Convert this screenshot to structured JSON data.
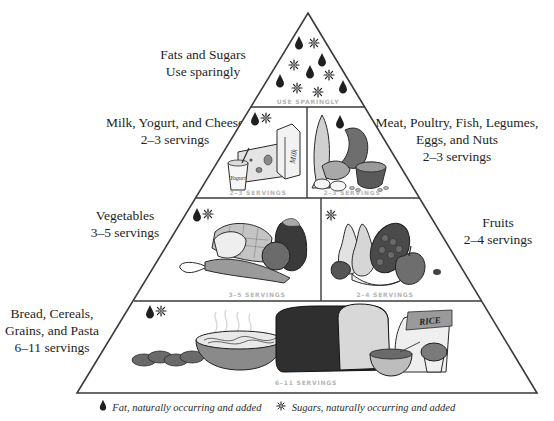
{
  "pyramid": {
    "tiers": [
      {
        "id": "fats-sugars",
        "group": "Fats and Sugars",
        "servings": "Use sparingly",
        "inner_label": "USE SPARINGLY",
        "symbols": [
          "fat-drop",
          "sugar-crystal"
        ]
      },
      {
        "id": "milk",
        "group": "Milk, Yogurt, and Cheese",
        "servings": "2–3 servings",
        "inner_label": "2–3 SERVINGS",
        "symbols": [
          "fat-drop",
          "sugar-crystal"
        ],
        "illustration": [
          "yogurt",
          "cheese",
          "milk carton"
        ],
        "carton_text": "Milk",
        "cup_text": "Yogurt"
      },
      {
        "id": "meat",
        "group_lines": [
          "Meat, Poultry, Fish, Legumes,",
          "Eggs, and Nuts"
        ],
        "servings": "2–3 servings",
        "inner_label": "2–3 SERVINGS",
        "symbols": [
          "fat-drop"
        ],
        "illustration": [
          "fish",
          "poultry",
          "eggs",
          "steak",
          "beans"
        ]
      },
      {
        "id": "vegetables",
        "group": "Vegetables",
        "servings": "3–5 servings",
        "inner_label": "3–5 SERVINGS",
        "symbols": [
          "fat-drop",
          "sugar-crystal"
        ],
        "illustration": [
          "corn",
          "lettuce",
          "carrot",
          "tomato",
          "eggplant"
        ]
      },
      {
        "id": "fruits",
        "group": "Fruits",
        "servings": "2–4 servings",
        "inner_label": "2–4 SERVINGS",
        "symbols": [
          "sugar-crystal"
        ],
        "illustration": [
          "pears",
          "grapes",
          "strawberry",
          "banana",
          "apple"
        ]
      },
      {
        "id": "grains",
        "group_lines": [
          "Bread, Cereals,",
          "Grains, and Pasta"
        ],
        "servings": "6–11 servings",
        "inner_label": "6–11 SERVINGS",
        "symbols": [
          "fat-drop",
          "sugar-crystal"
        ],
        "illustration": [
          "braided bread",
          "pasta bowl",
          "bread loaf",
          "rice bag",
          "cereal bowl",
          "muffin"
        ],
        "rice_bag_text": "RICE"
      }
    ]
  },
  "legend": {
    "fat": {
      "icon": "fat-drop-icon",
      "label": "Fat, naturally occurring and added"
    },
    "sugar": {
      "icon": "sugar-crystal-icon",
      "label": "Sugars, naturally occurring and added"
    }
  },
  "colors": {
    "outline": "#3a3a3a",
    "fill_dark": "#2b2b2b",
    "fill_mid": "#7a7a7a",
    "fill_light": "#c8c8c8",
    "inner_label": "#b4b4b4"
  }
}
